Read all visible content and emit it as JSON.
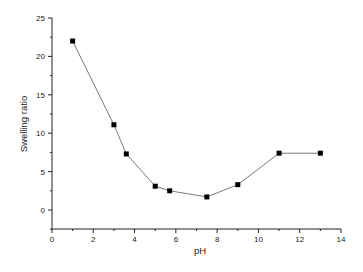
{
  "chart_data": {
    "type": "line",
    "title": "",
    "xlabel": "pH",
    "ylabel": "Swelling ratio",
    "xlim": [
      0,
      14
    ],
    "ylim": [
      -2.5,
      25
    ],
    "x_ticks": [
      0,
      2,
      4,
      6,
      8,
      10,
      12,
      14
    ],
    "y_ticks": [
      0,
      5,
      10,
      15,
      20,
      25
    ],
    "grid": false,
    "legend": null,
    "series": [
      {
        "name": "Swelling ratio",
        "marker": "square",
        "color": "#000000",
        "line_color": "#7a7a7a",
        "x": [
          1.0,
          3.0,
          3.6,
          5.0,
          5.7,
          7.5,
          9.0,
          11.0,
          13.0
        ],
        "y": [
          22.0,
          11.1,
          7.3,
          3.1,
          2.5,
          1.7,
          3.3,
          7.4,
          7.4
        ]
      }
    ]
  },
  "labels": {
    "xlabel": "pH",
    "ylabel": "Swelling ratio",
    "x_ticks": [
      "0",
      "2",
      "4",
      "6",
      "8",
      "10",
      "12",
      "14"
    ],
    "y_ticks": [
      "0",
      "5",
      "10",
      "15",
      "20",
      "25"
    ]
  }
}
